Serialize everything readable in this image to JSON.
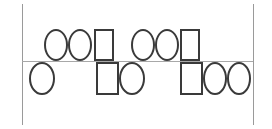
{
  "figure": {
    "title": "",
    "background_color": "#ffffff",
    "stroke_color": "#3a3a3a",
    "frame_color": "#9a9a9a",
    "divider_color": "#a8a8a8",
    "width": 272,
    "height": 129
  },
  "frame": {
    "left_border": {
      "name": "left-vertical-border",
      "x": 22,
      "y": 4,
      "height": 121
    },
    "right_border": {
      "name": "right-vertical-border",
      "x": 253,
      "y": 4,
      "height": 121
    },
    "divider": {
      "name": "horizontal-divider",
      "x": 22,
      "y": 61,
      "width": 231
    }
  },
  "rows": [
    {
      "name": "top-row",
      "label": "",
      "shapes": [
        {
          "name": "ellipse",
          "glyph": "O",
          "type": "ellipse",
          "x": 44,
          "y": 29,
          "w": 24,
          "h": 32
        },
        {
          "name": "ellipse",
          "glyph": "O",
          "type": "ellipse",
          "x": 68,
          "y": 29,
          "w": 24,
          "h": 32
        },
        {
          "name": "rectangle",
          "glyph": "□",
          "type": "rect",
          "x": 94,
          "y": 29,
          "w": 20,
          "h": 32
        },
        {
          "name": "ellipse",
          "glyph": "O",
          "type": "ellipse",
          "x": 131,
          "y": 29,
          "w": 24,
          "h": 32
        },
        {
          "name": "ellipse",
          "glyph": "O",
          "type": "ellipse",
          "x": 155,
          "y": 29,
          "w": 24,
          "h": 32
        },
        {
          "name": "rectangle",
          "glyph": "□",
          "type": "rect",
          "x": 180,
          "y": 29,
          "w": 20,
          "h": 32
        }
      ]
    },
    {
      "name": "bottom-row",
      "label": "",
      "shapes": [
        {
          "name": "ellipse",
          "glyph": "O",
          "type": "ellipse",
          "x": 29,
          "y": 62,
          "w": 26,
          "h": 33
        },
        {
          "name": "rectangle",
          "glyph": "□",
          "type": "rect",
          "x": 96,
          "y": 62,
          "w": 23,
          "h": 33
        },
        {
          "name": "ellipse",
          "glyph": "O",
          "type": "ellipse",
          "x": 119,
          "y": 62,
          "w": 26,
          "h": 33
        },
        {
          "name": "rectangle",
          "glyph": "□",
          "type": "rect",
          "x": 180,
          "y": 62,
          "w": 23,
          "h": 33
        },
        {
          "name": "ellipse",
          "glyph": "O",
          "type": "ellipse",
          "x": 203,
          "y": 62,
          "w": 24,
          "h": 33
        },
        {
          "name": "ellipse",
          "glyph": "O",
          "type": "ellipse",
          "x": 227,
          "y": 62,
          "w": 24,
          "h": 33
        }
      ]
    }
  ]
}
